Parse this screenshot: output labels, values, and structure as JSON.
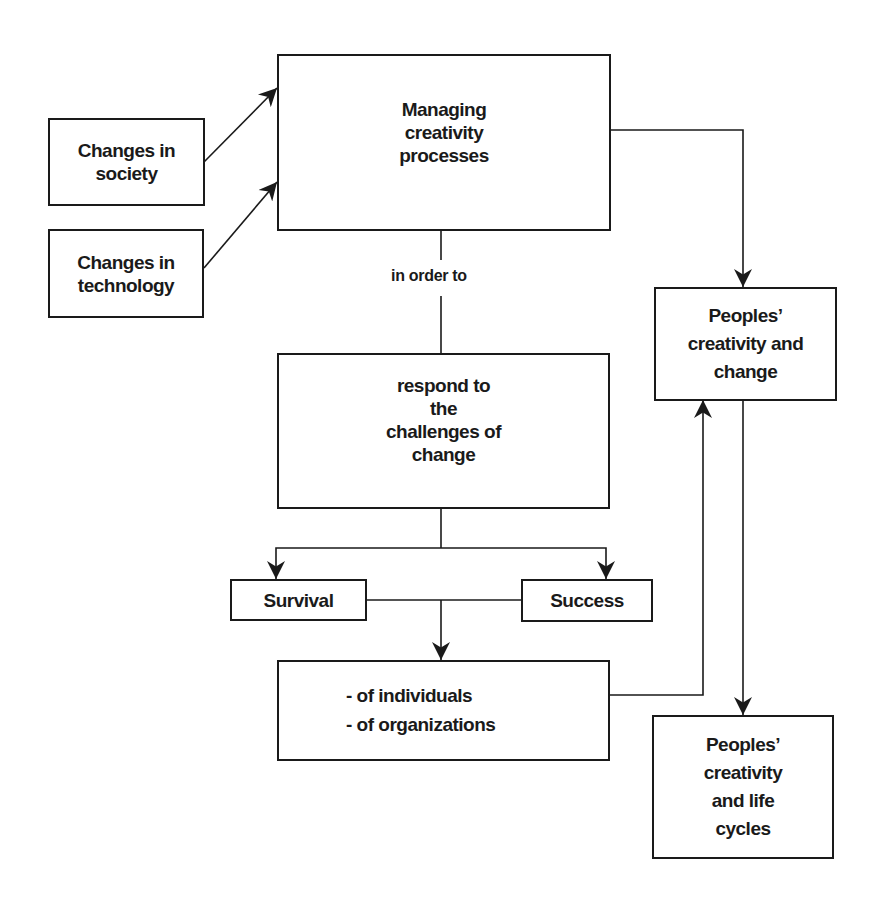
{
  "diagram": {
    "boxes": {
      "society": {
        "text": "Changes in\nsociety"
      },
      "technology": {
        "text": "Changes in\ntechnology"
      },
      "managing": {
        "text": "Managing\ncreativity\nprocesses"
      },
      "respond": {
        "text": "respond to\nthe\nchallenges of\nchange"
      },
      "survival": {
        "text": "Survival"
      },
      "success": {
        "text": "Success"
      },
      "of_whom": {
        "text": "- of individuals\n- of organizations"
      },
      "peoples_change": {
        "text": "Peoples’\ncreativity and\nchange"
      },
      "peoples_life": {
        "text": "Peoples’\ncreativity\nand life\ncycles"
      }
    },
    "connector_label": "in order to",
    "colors": {
      "stroke": "#1a1a1a",
      "background": "#ffffff"
    }
  }
}
